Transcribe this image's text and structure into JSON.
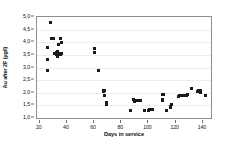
{
  "chart_data": {
    "type": "scatter",
    "title": "",
    "xlabel": "Days in service",
    "ylabel": "Au after 2F (µg/l)",
    "xlim": [
      18,
      146
    ],
    "ylim": [
      1.0,
      5.0
    ],
    "grid": true,
    "legend": false,
    "xticks": [
      "20",
      "40",
      "60",
      "80",
      "100",
      "120",
      "140"
    ],
    "xtick_values": [
      20,
      40,
      60,
      80,
      100,
      120,
      140
    ],
    "yticks": [
      "1,0",
      "1,5",
      "2,0",
      "2,5",
      "3,0",
      "3,5",
      "4,0",
      "4,5",
      "5,0"
    ],
    "ytick_values": [
      1.0,
      1.5,
      2.0,
      2.5,
      3.0,
      3.5,
      4.0,
      4.5,
      5.0
    ],
    "marker": "square",
    "marker_color": "#1a1a1a",
    "series": [
      {
        "name": "Au after 2F",
        "points": [
          [
            26,
            2.9
          ],
          [
            26,
            3.3
          ],
          [
            26,
            3.8
          ],
          [
            28,
            4.8
          ],
          [
            29,
            4.15
          ],
          [
            29,
            4.15
          ],
          [
            30,
            4.15
          ],
          [
            31,
            3.55
          ],
          [
            32,
            3.6
          ],
          [
            32,
            3.5
          ],
          [
            33,
            3.65
          ],
          [
            33,
            3.55
          ],
          [
            33,
            3.45
          ],
          [
            34,
            3.5
          ],
          [
            34,
            3.55
          ],
          [
            34,
            3.9
          ],
          [
            35,
            3.55
          ],
          [
            35,
            3.5
          ],
          [
            35,
            4.15
          ],
          [
            36,
            4.0
          ],
          [
            36,
            3.55
          ],
          [
            60,
            3.75
          ],
          [
            60,
            3.6
          ],
          [
            63,
            2.9
          ],
          [
            67,
            2.1
          ],
          [
            67,
            2.05
          ],
          [
            68,
            2.1
          ],
          [
            68,
            1.9
          ],
          [
            69,
            1.6
          ],
          [
            69,
            1.55
          ],
          [
            87,
            1.3
          ],
          [
            89,
            1.75
          ],
          [
            90,
            1.7
          ],
          [
            90,
            1.65
          ],
          [
            92,
            1.7
          ],
          [
            94,
            1.7
          ],
          [
            97,
            1.3
          ],
          [
            100,
            1.3
          ],
          [
            101,
            1.35
          ],
          [
            102,
            1.35
          ],
          [
            103,
            1.35
          ],
          [
            110,
            1.95
          ],
          [
            111,
            1.95
          ],
          [
            110,
            1.75
          ],
          [
            110,
            1.7
          ],
          [
            113,
            1.3
          ],
          [
            116,
            1.4
          ],
          [
            116,
            1.45
          ],
          [
            117,
            1.55
          ],
          [
            122,
            1.85
          ],
          [
            123,
            1.9
          ],
          [
            124,
            1.9
          ],
          [
            126,
            1.9
          ],
          [
            128,
            1.9
          ],
          [
            129,
            1.95
          ],
          [
            132,
            2.15
          ],
          [
            136,
            2.05
          ],
          [
            137,
            2.1
          ],
          [
            138,
            2.1
          ],
          [
            138,
            2.0
          ],
          [
            142,
            1.9
          ]
        ]
      }
    ]
  }
}
